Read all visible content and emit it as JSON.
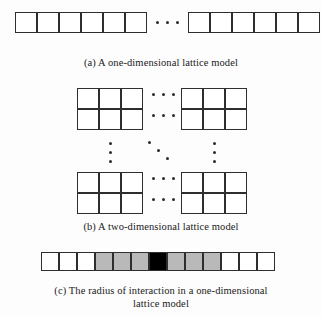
{
  "figure": {
    "background_color": "#fdfdfd",
    "line_color": "#2e2e2e",
    "shadow_color": "#6f6f6f",
    "panels": [
      {
        "id": "a",
        "label": "(a)",
        "caption": "(a)  A one-dimensional lattice model",
        "kind": "one-dimensional-lattice",
        "groups": [
          {
            "name": "left-segment",
            "columns": 6,
            "rows": 1,
            "cells": [
              "white",
              "white",
              "white",
              "white",
              "white",
              "white"
            ]
          },
          {
            "name": "right-segment",
            "columns": 6,
            "rows": 1,
            "cells": [
              "white",
              "white",
              "white",
              "white",
              "white",
              "white"
            ]
          }
        ],
        "ellipsis": [
          {
            "name": "between-segments",
            "orientation": "horizontal",
            "count": 3
          }
        ]
      },
      {
        "id": "b",
        "label": "(b)",
        "caption": "(b)  A two-dimensional lattice model",
        "kind": "two-dimensional-lattice",
        "groups": [
          {
            "name": "top-left-block",
            "columns": 3,
            "rows": 2
          },
          {
            "name": "top-right-block",
            "columns": 3,
            "rows": 2
          },
          {
            "name": "bottom-left-block",
            "columns": 3,
            "rows": 2
          },
          {
            "name": "bottom-right-block",
            "columns": 3,
            "rows": 2
          }
        ],
        "ellipsis": [
          {
            "name": "top-row-horizontal-upper",
            "orientation": "horizontal",
            "count": 3
          },
          {
            "name": "top-row-horizontal-lower",
            "orientation": "horizontal",
            "count": 3
          },
          {
            "name": "left-column-vertical",
            "orientation": "vertical",
            "count": 3
          },
          {
            "name": "center-diagonal",
            "orientation": "diagonal",
            "count": 3
          },
          {
            "name": "right-column-vertical",
            "orientation": "vertical",
            "count": 3
          },
          {
            "name": "bottom-row-horizontal-upper",
            "orientation": "horizontal",
            "count": 3
          },
          {
            "name": "bottom-row-horizontal-lower",
            "orientation": "horizontal",
            "count": 3
          }
        ]
      },
      {
        "id": "c",
        "label": "(c)",
        "caption_line1": "(c)  The radius of interaction in a one-dimensional",
        "caption_line2": "lattice model",
        "kind": "radius-of-interaction-strip",
        "strip": {
          "name": "interaction-strip",
          "columns": 13,
          "rows": 1,
          "cells": [
            "white",
            "white",
            "white",
            "gray",
            "gray",
            "gray",
            "black",
            "gray",
            "gray",
            "gray",
            "white",
            "white",
            "white"
          ],
          "center_index": 6,
          "radius": 3,
          "colors": {
            "white": "#ffffff",
            "gray": "#b9b9b9",
            "black": "#000000"
          }
        }
      }
    ]
  }
}
